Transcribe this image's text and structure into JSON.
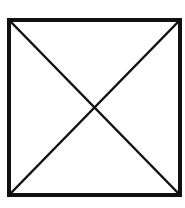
{
  "diagram": {
    "type": "square-with-diagonals",
    "canvas": {
      "width": 185,
      "height": 208
    },
    "background": "#ffffff",
    "stroke_color": "#111111",
    "square": {
      "x1": 9,
      "y1": 20,
      "x2": 180,
      "y2": 195,
      "border_width": 4
    },
    "diagonals": [
      {
        "from": [
          10,
          21
        ],
        "to": [
          179,
          194
        ],
        "width": 2.5
      },
      {
        "from": [
          179,
          21
        ],
        "to": [
          10,
          194
        ],
        "width": 2.5
      }
    ],
    "intersection": [
      94,
      108
    ]
  }
}
